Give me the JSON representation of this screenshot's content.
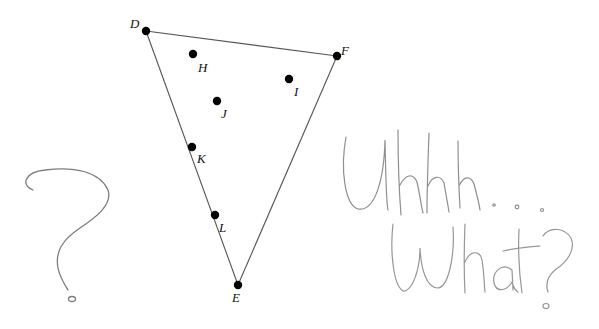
{
  "diagram": {
    "triangle": {
      "vertices": [
        {
          "name": "D",
          "x": 146,
          "y": 31,
          "label_x": 130,
          "label_y": 17
        },
        {
          "name": "F",
          "x": 337,
          "y": 56,
          "label_x": 341,
          "label_y": 44
        },
        {
          "name": "E",
          "x": 238,
          "y": 285,
          "label_x": 232,
          "label_y": 291
        }
      ],
      "edges": [
        [
          "D",
          "F"
        ],
        [
          "F",
          "E"
        ],
        [
          "E",
          "D"
        ]
      ],
      "stroke_color": "#555555"
    },
    "points": [
      {
        "name": "H",
        "x": 193,
        "y": 54,
        "label_x": 198,
        "label_y": 61
      },
      {
        "name": "I",
        "x": 289,
        "y": 79,
        "label_x": 294,
        "label_y": 85
      },
      {
        "name": "J",
        "x": 217,
        "y": 101,
        "label_x": 221,
        "label_y": 107
      },
      {
        "name": "K",
        "x": 192,
        "y": 147,
        "label_x": 197,
        "label_y": 152
      },
      {
        "name": "L",
        "x": 215,
        "y": 215,
        "label_x": 219,
        "label_y": 221
      }
    ],
    "point_color": "#000000",
    "handwritten": {
      "question_mark": "?",
      "line1": "Uhhh...",
      "line2": "What?",
      "pencil_color": "#8a8a8a"
    }
  }
}
